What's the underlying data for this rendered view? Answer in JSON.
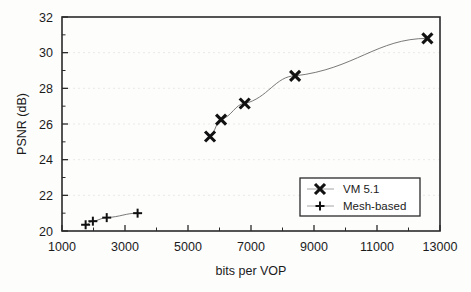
{
  "chart_data": {
    "type": "scatter",
    "title": "",
    "xlabel": "bits per VOP",
    "ylabel": "PSNR (dB)",
    "xlim": [
      1000,
      13000
    ],
    "ylim": [
      20,
      32
    ],
    "x_ticks": [
      1000,
      3000,
      5000,
      7000,
      9000,
      11000,
      13000
    ],
    "x_tick_labels": [
      "1000",
      "3000",
      "5000",
      "7000",
      "9000",
      "11000",
      "13000"
    ],
    "x_minor_step": 1000,
    "y_ticks": [
      20,
      22,
      24,
      26,
      28,
      30,
      32
    ],
    "y_tick_labels": [
      "20",
      "22",
      "24",
      "26",
      "28",
      "30",
      "32"
    ],
    "y_minor_step": 1,
    "grid": true,
    "grid_axis": "y",
    "legend_position": "lower-right",
    "series": [
      {
        "name": "VM 5.1",
        "marker": "x",
        "line": true,
        "points": [
          {
            "x": 5700,
            "y": 25.3
          },
          {
            "x": 6050,
            "y": 26.25
          },
          {
            "x": 6800,
            "y": 27.15
          },
          {
            "x": 8400,
            "y": 28.7
          },
          {
            "x": 12600,
            "y": 30.8
          }
        ]
      },
      {
        "name": "Mesh-based",
        "marker": "plus",
        "line": true,
        "points": [
          {
            "x": 1750,
            "y": 20.35
          },
          {
            "x": 1980,
            "y": 20.55
          },
          {
            "x": 2420,
            "y": 20.75
          },
          {
            "x": 3400,
            "y": 21.0
          }
        ]
      }
    ],
    "legend_entries": [
      {
        "label": "VM 5.1",
        "marker": "x"
      },
      {
        "label": "Mesh-based",
        "marker": "plus"
      }
    ],
    "colors": {
      "marker": "#111111",
      "line": "#6a6a6a",
      "frame": "#2a2a2a",
      "grid": "#e6e6e6",
      "background": "#fdfdfc"
    }
  }
}
